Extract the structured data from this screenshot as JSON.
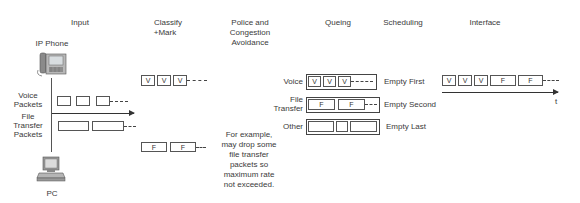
{
  "headers": {
    "input": "Input",
    "classify_line1": "Classify",
    "classify_line2": "+Mark",
    "police_line1": "Police and",
    "police_line2": "Congestion",
    "police_line3": "Avoidance",
    "queuing": "Queing",
    "scheduling": "Scheduling",
    "interface": "Interface"
  },
  "input": {
    "ip_phone_label": "IP Phone",
    "pc_label": "PC",
    "voice_packets_line1": "Voice",
    "voice_packets_line2": "Packets",
    "file_packets_line1": "File",
    "file_packets_line2": "Transfer",
    "file_packets_line3": "Packets"
  },
  "classify": {
    "voice_marks": [
      "V",
      "V",
      "V"
    ],
    "file_marks": [
      "F",
      "F"
    ]
  },
  "police": {
    "note_lines": [
      "For example,",
      "may drop some",
      "file transfer",
      "packets so",
      "maximum rate",
      "not exceeded."
    ]
  },
  "queues": [
    {
      "name": "Voice",
      "contents": [
        "V",
        "V",
        "V"
      ],
      "schedule": "Empty First"
    },
    {
      "name_line1": "File",
      "name_line2": "Transfer",
      "contents": [
        "F",
        "F"
      ],
      "schedule": "Empty Second"
    },
    {
      "name": "Other",
      "contents": [
        "",
        "",
        ""
      ],
      "schedule": "Empty Last"
    }
  ],
  "interface": {
    "sequence": [
      "V",
      "V",
      "V",
      "F",
      "F"
    ],
    "time_axis_label": "t"
  }
}
